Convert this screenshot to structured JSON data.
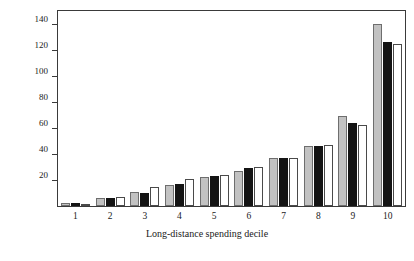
{
  "chart_data": {
    "type": "bar",
    "title": "",
    "xlabel": "Long-distance spending decile",
    "ylabel": "",
    "categories": [
      "1",
      "2",
      "3",
      "4",
      "5",
      "6",
      "7",
      "8",
      "9",
      "10"
    ],
    "series": [
      {
        "name": "Canada, 1992",
        "color": "#c2c2c2",
        "values": [
          2,
          6,
          11,
          16,
          22,
          27,
          37,
          46,
          69,
          140
        ]
      },
      {
        "name": "United States, 1996",
        "color": "#141414",
        "values": [
          2,
          6,
          10,
          17,
          23,
          29,
          37,
          46,
          64,
          126
        ]
      },
      {
        "name": "United Kingdom, 1995",
        "color": "#ffffff",
        "values": [
          1,
          7,
          15,
          21,
          24,
          30,
          37,
          47,
          62,
          125
        ]
      }
    ],
    "ylim": [
      0,
      150
    ],
    "yticks": [
      20,
      40,
      60,
      80,
      100,
      120,
      140
    ],
    "grid": false,
    "legend_position": "top-left"
  },
  "legend": {
    "entries": [
      {
        "label": "Canada, 1992"
      },
      {
        "label": "United States, 1996"
      },
      {
        "label": "United Kingdom, 1995"
      }
    ]
  },
  "axis": {
    "x_label": "Long-distance spending decile",
    "y_ticks": [
      "20",
      "40",
      "60",
      "80",
      "100",
      "120",
      "140"
    ],
    "x_ticks": [
      "1",
      "2",
      "3",
      "4",
      "5",
      "6",
      "7",
      "8",
      "9",
      "10"
    ]
  }
}
